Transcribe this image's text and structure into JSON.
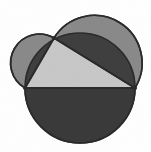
{
  "figure": {
    "name": "lunes-of-hippocrates",
    "background_color": "#ffffff",
    "canvas": {
      "width": 151,
      "height": 152
    },
    "stroke_color": "#2b2b2b",
    "stroke_width": 1.6,
    "colors": {
      "triangle_fill": "#c8c8c8",
      "lune_fill": "#8a8a8a",
      "hypotenuse_semicircle_fill": "#3a3a3a",
      "leg_band_fill": "#3f3f3f",
      "outline": "#2b2b2b"
    },
    "vertices": {
      "left": {
        "label": "A",
        "x": 25,
        "y": 88
      },
      "apex": {
        "label": "C",
        "x": 54,
        "y": 38
      },
      "right": {
        "label": "B",
        "x": 135,
        "y": 88
      }
    },
    "circles": [
      {
        "name": "hypotenuse-circle",
        "role": "circle on hypotenuse AB",
        "cx": 80,
        "cy": 88,
        "r": 55,
        "fill": "#8a8a8a"
      },
      {
        "name": "left-leg-semicircle",
        "role": "semicircle on leg AC",
        "cx": 39.5,
        "cy": 63,
        "r": 28.8,
        "fill": "#8a8a8a"
      },
      {
        "name": "right-leg-semicircle",
        "role": "semicircle on leg CB",
        "cx": 94.5,
        "cy": 63,
        "r": 48.3,
        "fill": "#8a8a8a"
      }
    ],
    "regions": [
      {
        "name": "lower-semicircle",
        "fill": "#3a3a3a",
        "description": "dark half-disc below the hypotenuse"
      },
      {
        "name": "triangle",
        "fill": "#c8c8c8",
        "description": "light right triangle ABC"
      },
      {
        "name": "left-lune",
        "fill": "#8a8a8a",
        "description": "lune over the short leg"
      },
      {
        "name": "right-lune",
        "fill": "#8a8a8a",
        "description": "lune over the long leg"
      },
      {
        "name": "left-leg-band",
        "fill": "#3f3f3f",
        "description": "dark circular segment between leg AC and the hypotenuse circle"
      },
      {
        "name": "right-leg-band",
        "fill": "#3f3f3f",
        "description": "dark circular segment between leg CB and the hypotenuse circle"
      }
    ]
  }
}
